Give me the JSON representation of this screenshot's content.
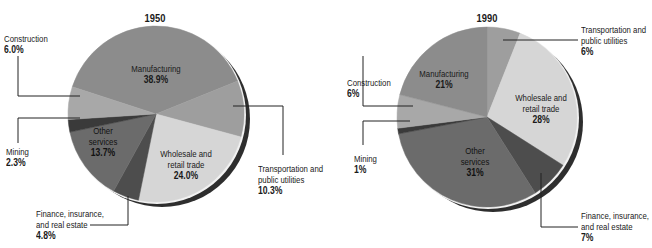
{
  "header": {
    "title_partial": "Percentage of employees by industry (cut off at top of image)"
  },
  "chart_data": [
    {
      "type": "pie",
      "title": "1950",
      "unit": "%",
      "start_angle_deg": 288,
      "direction": "clockwise",
      "slices": [
        {
          "label": "Manufacturing",
          "value": 38.9,
          "display": "38.9%",
          "color": "#8c8c8c"
        },
        {
          "label": "Transportation and public utilities",
          "value": 10.3,
          "display": "10.3%",
          "color": "#9e9e9e"
        },
        {
          "label": "Wholesale and retail trade",
          "value": 24.0,
          "display": "24.0%",
          "color": "#d6d6d6"
        },
        {
          "label": "Finance, insurance, and real estate",
          "value": 4.8,
          "display": "4.8%",
          "color": "#4d4d4d"
        },
        {
          "label": "Other services",
          "value": 13.7,
          "display": "13.7%",
          "color": "#6b6b6b"
        },
        {
          "label": "Mining",
          "value": 2.3,
          "display": "2.3%",
          "color": "#3a3a3a"
        },
        {
          "label": "Construction",
          "value": 6.0,
          "display": "6.0%",
          "color": "#a8a8a8"
        }
      ]
    },
    {
      "type": "pie",
      "title": "1990",
      "unit": "%",
      "start_angle_deg": 0,
      "direction": "clockwise",
      "slices": [
        {
          "label": "Transportation and public utilities",
          "value": 6,
          "display": "6%",
          "color": "#9e9e9e"
        },
        {
          "label": "Wholesale and retail trade",
          "value": 28,
          "display": "28%",
          "color": "#d6d6d6"
        },
        {
          "label": "Finance, insurance, and real estate",
          "value": 7,
          "display": "7%",
          "color": "#4d4d4d"
        },
        {
          "label": "Other services",
          "value": 31,
          "display": "31%",
          "color": "#6b6b6b"
        },
        {
          "label": "Mining",
          "value": 1,
          "display": "1%",
          "color": "#3a3a3a"
        },
        {
          "label": "Construction",
          "value": 6,
          "display": "6%",
          "color": "#a8a8a8"
        },
        {
          "label": "Manufacturing",
          "value": 21,
          "display": "21%",
          "color": "#8c8c8c"
        }
      ]
    }
  ],
  "pie1950": {
    "year": "1950",
    "manufacturing": {
      "name": "Manufacturing",
      "pct": "38.9%"
    },
    "construction": {
      "name": "Construction",
      "pct": "6.0%"
    },
    "mining": {
      "name": "Mining",
      "pct": "2.3%"
    },
    "other": {
      "name1": "Other",
      "name2": "services",
      "pct": "13.7%"
    },
    "wholesale": {
      "name1": "Wholesale and",
      "name2": "retail trade",
      "pct": "24.0%"
    },
    "transport": {
      "name1": "Transportation and",
      "name2": "public utilities",
      "pct": "10.3%"
    },
    "finance": {
      "name1": "Finance, insurance,",
      "name2": "and real estate",
      "pct": "4.8%"
    }
  },
  "pie1990": {
    "year": "1990",
    "manufacturing": {
      "name": "Manufacturing",
      "pct": "21%"
    },
    "construction": {
      "name": "Construction",
      "pct": "6%"
    },
    "mining": {
      "name": "Mining",
      "pct": "1%"
    },
    "other": {
      "name1": "Other",
      "name2": "services",
      "pct": "31%"
    },
    "wholesale": {
      "name1": "Wholesale and",
      "name2": "retail trade",
      "pct": "28%"
    },
    "transport": {
      "name1": "Transportation and",
      "name2": "public utilities",
      "pct": "6%"
    },
    "finance": {
      "name1": "Finance, insurance,",
      "name2": "and real estate",
      "pct": "7%"
    }
  }
}
